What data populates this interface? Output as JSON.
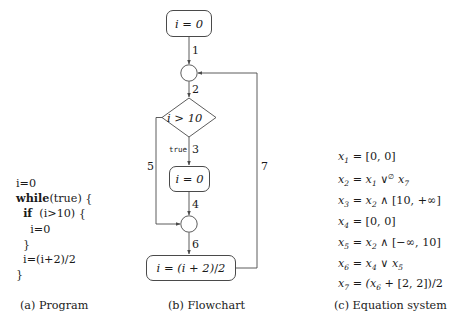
{
  "figure": {
    "panels": {
      "program": {
        "caption": "(a) Program",
        "lines": [
          {
            "indent": 0,
            "text": "i=0",
            "bold_prefix": ""
          },
          {
            "indent": 0,
            "text": "(true) {",
            "bold_prefix": "while"
          },
          {
            "indent": 1,
            "text": " (i>10) {",
            "bold_prefix": "if"
          },
          {
            "indent": 2,
            "text": "i=0",
            "bold_prefix": ""
          },
          {
            "indent": 1,
            "text": "}",
            "bold_prefix": ""
          },
          {
            "indent": 1,
            "text": "i=(i+2)/2",
            "bold_prefix": ""
          },
          {
            "indent": 0,
            "text": "}",
            "bold_prefix": ""
          }
        ]
      },
      "flowchart": {
        "caption": "(b) Flowchart",
        "nodes": [
          {
            "id": "entry-assign",
            "shape": "rounded-box",
            "label": "i = 0"
          },
          {
            "id": "loop-head-junction",
            "shape": "circle",
            "label": ""
          },
          {
            "id": "condition",
            "shape": "diamond",
            "label": "i > 10"
          },
          {
            "id": "then-assign",
            "shape": "rounded-box",
            "label": "i = 0"
          },
          {
            "id": "merge-junction",
            "shape": "circle",
            "label": ""
          },
          {
            "id": "update-assign",
            "shape": "rounded-box",
            "label": "i = (i + 2)/2"
          }
        ],
        "edges": [
          {
            "id": "e1",
            "label": "1",
            "from": "entry-assign",
            "to": "loop-head-junction"
          },
          {
            "id": "e2",
            "label": "2",
            "from": "loop-head-junction",
            "to": "condition"
          },
          {
            "id": "e3",
            "label": "3",
            "branch": "true",
            "from": "condition",
            "to": "then-assign"
          },
          {
            "id": "e4",
            "label": "4",
            "from": "then-assign",
            "to": "merge-junction"
          },
          {
            "id": "e5",
            "label": "5",
            "from": "condition",
            "to": "merge-junction"
          },
          {
            "id": "e6",
            "label": "6",
            "from": "merge-junction",
            "to": "update-assign"
          },
          {
            "id": "e7",
            "label": "7",
            "from": "update-assign",
            "to": "loop-head-junction"
          }
        ]
      },
      "equations": {
        "caption": "(c) Equation system",
        "lines": [
          {
            "id": "eq1",
            "lhs_var": "x",
            "lhs_sub": "1",
            "rhs": "= [0, 0]"
          },
          {
            "id": "eq2",
            "lhs_var": "x",
            "lhs_sub": "2",
            "rhs": "= x₁ ∨∅ x₇"
          },
          {
            "id": "eq3",
            "lhs_var": "x",
            "lhs_sub": "3",
            "rhs": "= x₂ ∧ [10, +∞]"
          },
          {
            "id": "eq4",
            "lhs_var": "x",
            "lhs_sub": "4",
            "rhs": "= [0, 0]"
          },
          {
            "id": "eq5",
            "lhs_var": "x",
            "lhs_sub": "5",
            "rhs": "= x₂ ∧ [−∞, 10]"
          },
          {
            "id": "eq6",
            "lhs_var": "x",
            "lhs_sub": "6",
            "rhs": "= x₄ ∨ x₅"
          },
          {
            "id": "eq7",
            "lhs_var": "x",
            "lhs_sub": "7",
            "rhs": "= (x₆ + [2, 2])/2"
          }
        ]
      }
    },
    "colors": {
      "stroke": "#4a4a4a",
      "text": "#1a1a1a",
      "background": "#ffffff"
    }
  }
}
